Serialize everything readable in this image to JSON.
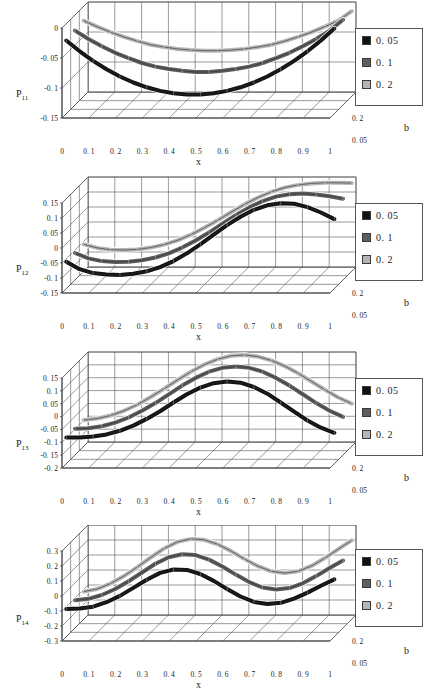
{
  "figure": {
    "kind": "four-panel 3d line chart figure",
    "background": "#ffffff",
    "legend_colors": {
      "s1": "#121212",
      "s2": "#5e5e5e",
      "s3": "#b5b5b5"
    },
    "grid_color": "#555555",
    "depth_axis_title": "b",
    "x_axis_title": "x",
    "depth_ticks": [
      "0. 2",
      "0. 05"
    ],
    "legend_entries": [
      {
        "label": "0. 05",
        "color": "#121212"
      },
      {
        "label": "0. 1",
        "color": "#5e5e5e"
      },
      {
        "label": "0. 2",
        "color": "#b5b5b5"
      }
    ]
  },
  "chart_data": [
    {
      "type": "line",
      "title": "P11",
      "y_label": "P",
      "y_label_sub": "11",
      "xlabel": "x",
      "ylabel": "P11",
      "zlabel": "b",
      "grid": true,
      "legend_position": "right",
      "xlim": [
        0,
        1
      ],
      "ylim": [
        -0.15,
        0
      ],
      "xticks": [
        "0",
        "0. 1",
        "0. 2",
        "0. 3",
        "0. 4",
        "0. 5",
        "0. 6",
        "0. 7",
        "0. 8",
        "0. 9",
        "1"
      ],
      "yticks": [
        "0",
        "-0. 05",
        "-0. 1",
        "-0. 15"
      ],
      "zticks": [
        "0. 2",
        "0. 05"
      ],
      "x": [
        0,
        0.05,
        0.1,
        0.15,
        0.2,
        0.25,
        0.3,
        0.35,
        0.4,
        0.45,
        0.5,
        0.55,
        0.6,
        0.65,
        0.7,
        0.75,
        0.8,
        0.85,
        0.9,
        0.95,
        1
      ],
      "series": [
        {
          "name": "0.05",
          "color": "#121212",
          "values": [
            -0.028,
            -0.046,
            -0.062,
            -0.076,
            -0.088,
            -0.098,
            -0.106,
            -0.112,
            -0.116,
            -0.118,
            -0.118,
            -0.116,
            -0.112,
            -0.106,
            -0.098,
            -0.088,
            -0.076,
            -0.062,
            -0.046,
            -0.028,
            -0.008
          ]
        },
        {
          "name": "0.1",
          "color": "#5e5e5e",
          "values": [
            -0.026,
            -0.04,
            -0.052,
            -0.063,
            -0.072,
            -0.08,
            -0.086,
            -0.09,
            -0.093,
            -0.095,
            -0.095,
            -0.093,
            -0.09,
            -0.086,
            -0.08,
            -0.072,
            -0.063,
            -0.052,
            -0.04,
            -0.026,
            -0.008
          ]
        },
        {
          "name": "0.2",
          "color": "#b5b5b5",
          "values": [
            -0.024,
            -0.034,
            -0.043,
            -0.051,
            -0.058,
            -0.064,
            -0.068,
            -0.071,
            -0.073,
            -0.074,
            -0.074,
            -0.073,
            -0.071,
            -0.068,
            -0.064,
            -0.058,
            -0.051,
            -0.043,
            -0.034,
            -0.024,
            -0.008
          ]
        }
      ]
    },
    {
      "type": "line",
      "title": "P12",
      "y_label": "P",
      "y_label_sub": "12",
      "xlabel": "x",
      "ylabel": "P12",
      "zlabel": "b",
      "grid": true,
      "legend_position": "right",
      "xlim": [
        0,
        1
      ],
      "ylim": [
        -0.15,
        0.15
      ],
      "xticks": [
        "0",
        "0. 1",
        "0. 2",
        "0. 3",
        "0. 4",
        "0. 5",
        "0. 6",
        "0. 7",
        "0. 8",
        "0. 9",
        "1"
      ],
      "yticks": [
        "0. 15",
        "0. 1",
        "0. 05",
        "0",
        "-0. 05",
        "-0. 1",
        "-0. 15"
      ],
      "zticks": [
        "0. 2",
        "0. 05"
      ],
      "x": [
        0,
        0.05,
        0.1,
        0.15,
        0.2,
        0.25,
        0.3,
        0.35,
        0.4,
        0.45,
        0.5,
        0.55,
        0.6,
        0.65,
        0.7,
        0.75,
        0.8,
        0.85,
        0.9,
        0.95,
        1
      ],
      "series": [
        {
          "name": "0.05",
          "color": "#121212",
          "values": [
            -0.06,
            -0.085,
            -0.098,
            -0.103,
            -0.104,
            -0.1,
            -0.092,
            -0.078,
            -0.058,
            -0.032,
            -0.002,
            0.03,
            0.062,
            0.09,
            0.113,
            0.128,
            0.135,
            0.133,
            0.122,
            0.104,
            0.082
          ]
        },
        {
          "name": "0.1",
          "color": "#5e5e5e",
          "values": [
            -0.06,
            -0.078,
            -0.087,
            -0.09,
            -0.089,
            -0.084,
            -0.075,
            -0.061,
            -0.042,
            -0.018,
            0.008,
            0.038,
            0.066,
            0.092,
            0.113,
            0.128,
            0.136,
            0.138,
            0.135,
            0.129,
            0.121
          ]
        },
        {
          "name": "0.2",
          "color": "#b5b5b5",
          "values": [
            -0.06,
            -0.072,
            -0.078,
            -0.079,
            -0.077,
            -0.071,
            -0.061,
            -0.047,
            -0.028,
            -0.005,
            0.02,
            0.047,
            0.073,
            0.096,
            0.115,
            0.129,
            0.138,
            0.143,
            0.145,
            0.145,
            0.144
          ]
        }
      ]
    },
    {
      "type": "line",
      "title": "P13",
      "y_label": "P",
      "y_label_sub": "13",
      "xlabel": "x",
      "ylabel": "P13",
      "zlabel": "b",
      "grid": true,
      "legend_position": "right",
      "xlim": [
        0,
        1
      ],
      "ylim": [
        -0.2,
        0.15
      ],
      "xticks": [
        "0",
        "0. 1",
        "0. 2",
        "0. 3",
        "0. 4",
        "0. 5",
        "0. 6",
        "0. 7",
        "0. 8",
        "0. 9",
        "1"
      ],
      "yticks": [
        "0. 15",
        "0. 1",
        "0. 05",
        "0",
        "-0. 05",
        "-0. 1",
        "-0. 15",
        "-0. 2"
      ],
      "zticks": [
        "0. 2",
        "0. 05"
      ],
      "x": [
        0,
        0.05,
        0.1,
        0.15,
        0.2,
        0.25,
        0.3,
        0.35,
        0.4,
        0.45,
        0.5,
        0.55,
        0.6,
        0.65,
        0.7,
        0.75,
        0.8,
        0.85,
        0.9,
        0.95,
        1
      ],
      "series": [
        {
          "name": "0.05",
          "color": "#121212",
          "values": [
            -0.098,
            -0.098,
            -0.094,
            -0.086,
            -0.072,
            -0.052,
            -0.026,
            0.004,
            0.038,
            0.07,
            0.096,
            0.113,
            0.12,
            0.115,
            0.098,
            0.072,
            0.038,
            0.002,
            -0.032,
            -0.06,
            -0.08
          ]
        },
        {
          "name": "0.1",
          "color": "#5e5e5e",
          "values": [
            -0.098,
            -0.096,
            -0.088,
            -0.074,
            -0.054,
            -0.028,
            0.002,
            0.036,
            0.07,
            0.1,
            0.124,
            0.139,
            0.144,
            0.139,
            0.124,
            0.1,
            0.07,
            0.036,
            0.002,
            -0.028,
            -0.052
          ]
        },
        {
          "name": "0.2",
          "color": "#b5b5b5",
          "values": [
            -0.098,
            -0.092,
            -0.08,
            -0.062,
            -0.038,
            -0.008,
            0.024,
            0.058,
            0.09,
            0.118,
            0.139,
            0.152,
            0.155,
            0.149,
            0.134,
            0.112,
            0.084,
            0.052,
            0.02,
            -0.01,
            -0.034
          ]
        }
      ]
    },
    {
      "type": "line",
      "title": "P14",
      "y_label": "P",
      "y_label_sub": "14",
      "xlabel": "x",
      "ylabel": "P14",
      "zlabel": "b",
      "grid": true,
      "legend_position": "right",
      "xlim": [
        0,
        1
      ],
      "ylim": [
        -0.3,
        0.3
      ],
      "xticks": [
        "0",
        "0. 1",
        "0. 2",
        "0. 3",
        "0. 4",
        "0. 5",
        "0. 6",
        "0. 7",
        "0. 8",
        "0. 9",
        "1"
      ],
      "yticks": [
        "0. 3",
        "0. 2",
        "0. 1",
        "0",
        "-0. 1",
        "-0. 2",
        "-0. 3"
      ],
      "zticks": [
        "0. 2",
        "0. 05"
      ],
      "x": [
        0,
        0.05,
        0.1,
        0.15,
        0.2,
        0.25,
        0.3,
        0.35,
        0.4,
        0.45,
        0.5,
        0.55,
        0.6,
        0.65,
        0.7,
        0.75,
        0.8,
        0.85,
        0.9,
        0.95,
        1
      ],
      "series": [
        {
          "name": "0.05",
          "color": "#121212",
          "values": [
            -0.115,
            -0.112,
            -0.1,
            -0.07,
            -0.028,
            0.025,
            0.08,
            0.125,
            0.148,
            0.145,
            0.118,
            0.072,
            0.018,
            -0.032,
            -0.068,
            -0.082,
            -0.074,
            -0.046,
            -0.006,
            0.04,
            0.082
          ]
        },
        {
          "name": "0.1",
          "color": "#5e5e5e",
          "values": [
            -0.115,
            -0.105,
            -0.08,
            -0.04,
            0.012,
            0.07,
            0.128,
            0.172,
            0.192,
            0.186,
            0.156,
            0.11,
            0.056,
            0.006,
            -0.03,
            -0.044,
            -0.034,
            -0.002,
            0.046,
            0.1,
            0.15
          ]
        },
        {
          "name": "0.2",
          "color": "#b5b5b5",
          "values": [
            -0.115,
            -0.098,
            -0.062,
            -0.012,
            0.048,
            0.112,
            0.172,
            0.216,
            0.236,
            0.23,
            0.2,
            0.155,
            0.102,
            0.054,
            0.02,
            0.008,
            0.02,
            0.056,
            0.108,
            0.168,
            0.226
          ]
        }
      ]
    }
  ]
}
